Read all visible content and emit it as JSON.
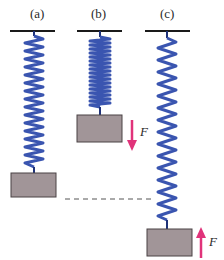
{
  "figure": {
    "panels": [
      {
        "id": "a",
        "label": "(a)",
        "state": "equilibrium"
      },
      {
        "id": "b",
        "label": "(b)",
        "state": "compressed",
        "force_label": "F",
        "force_direction": "down"
      },
      {
        "id": "c",
        "label": "(c)",
        "state": "stretched",
        "force_label": "F",
        "force_direction": "up"
      }
    ],
    "colors": {
      "spring": "#3a55b0",
      "spring_dark": "#1f3278",
      "block": "#a19598",
      "block_border": "#4a4245",
      "ceiling": "#1a1a1a",
      "arrow": "#e0337a",
      "dashed_line": "#555555"
    }
  }
}
